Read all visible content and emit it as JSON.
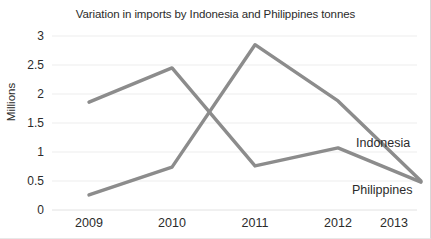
{
  "chart_data": {
    "type": "line",
    "title": "Variation in imports by Indonesia and Philippines tonnes",
    "xlabel": "",
    "ylabel": "Millions",
    "categories": [
      "2009",
      "2010",
      "2011",
      "2012",
      "2013"
    ],
    "ylim": [
      0,
      3
    ],
    "yticks": [
      "0",
      "0.5",
      "1",
      "1.5",
      "2",
      "2.5",
      "3"
    ],
    "ytick_values": [
      0,
      0.5,
      1,
      1.5,
      2,
      2.5,
      3
    ],
    "grid": true,
    "legend_position": "inline-right",
    "series": [
      {
        "name": "Indonesia",
        "color": "#8c8c8c",
        "values": [
          1.86,
          2.45,
          0.76,
          1.07,
          0.48
        ]
      },
      {
        "name": "Philippines",
        "color": "#8c8c8c",
        "values": [
          0.26,
          0.74,
          2.85,
          1.88,
          0.5
        ]
      }
    ],
    "annotations": [
      {
        "text": "Indonesia",
        "series": "Indonesia"
      },
      {
        "text": "Philippines",
        "series": "Philippines"
      }
    ]
  },
  "axis": {
    "ylabel": "Millions",
    "y_tick_0": "0",
    "y_tick_1": "0.5",
    "y_tick_2": "1",
    "y_tick_3": "1.5",
    "y_tick_4": "2",
    "y_tick_5": "2.5",
    "y_tick_6": "3",
    "x_tick_0": "2009",
    "x_tick_1": "2010",
    "x_tick_2": "2011",
    "x_tick_3": "2012",
    "x_tick_4": "2013"
  },
  "labels": {
    "indonesia": "Indonesia",
    "philippines": "Philippines"
  },
  "colors": {
    "line": "#8c8c8c",
    "grid": "#ededed",
    "text": "#2b2b2b"
  }
}
